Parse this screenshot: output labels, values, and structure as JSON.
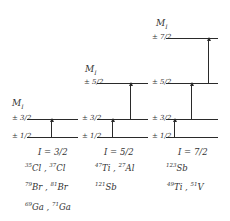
{
  "diagram": {
    "axis_label": "M",
    "axis_label_sub": "I",
    "panels": [
      {
        "spin": "I = 3/2",
        "levels": [
          "± 3/2",
          "± 1/2"
        ],
        "nuclei_rows": [
          [
            {
              "mass": "35",
              "sym": "Cl"
            },
            {
              "mass": "37",
              "sym": "Cl"
            }
          ],
          [
            {
              "mass": "79",
              "sym": "Br"
            },
            {
              "mass": "81",
              "sym": "Br"
            }
          ],
          [
            {
              "mass": "69",
              "sym": "Ga"
            },
            {
              "mass": "71",
              "sym": "Ga"
            }
          ]
        ]
      },
      {
        "spin": "I = 5/2",
        "levels": [
          "± 5/2",
          "± 3/2",
          "± 1/2"
        ],
        "nuclei_rows": [
          [
            {
              "mass": "47",
              "sym": "Ti"
            },
            {
              "mass": "27",
              "sym": "Al"
            }
          ],
          [
            {
              "mass": "121",
              "sym": "Sb"
            }
          ]
        ]
      },
      {
        "spin": "I = 7/2",
        "levels": [
          "± 7/2",
          "± 5/2",
          "± 3/2",
          "± 1/2"
        ],
        "nuclei_rows": [
          [
            {
              "mass": "123",
              "sym": "Sb"
            }
          ],
          [
            {
              "mass": "49",
              "sym": "Ti"
            },
            {
              "mass": "51",
              "sym": "V"
            }
          ]
        ]
      }
    ],
    "separator": " , "
  }
}
